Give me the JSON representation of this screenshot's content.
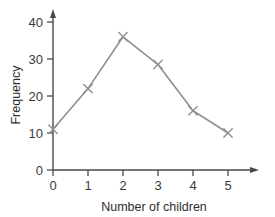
{
  "chart_data": {
    "type": "line",
    "title": "",
    "subtitle": "",
    "xlabel": "Number of children",
    "ylabel": "Frequency",
    "x": [
      0,
      1,
      2,
      3,
      4,
      5
    ],
    "categories": [
      "0",
      "1",
      "2",
      "3",
      "4",
      "5"
    ],
    "values": [
      11,
      22,
      36,
      28.5,
      16,
      10
    ],
    "series": [
      {
        "name": "Frequency",
        "values": [
          11,
          22,
          36,
          28.5,
          16,
          10
        ]
      }
    ],
    "xlim": [
      0,
      5
    ],
    "ylim": [
      0,
      40
    ],
    "xticks": [
      "0",
      "1",
      "2",
      "3",
      "4",
      "5"
    ],
    "yticks": [
      "0",
      "10",
      "20",
      "30",
      "40"
    ],
    "ytick_values": [
      0,
      10,
      20,
      30,
      40
    ],
    "grid": false,
    "legend": false,
    "legend_position": "none",
    "marker": "x-cross",
    "line_color": "#8f8f8f",
    "marker_color": "#8f8f8f",
    "axis_color": "#4a4a4a",
    "background_color": "#ffffff",
    "axis_arrows": true,
    "annotations": []
  },
  "axes": {
    "y_title": "Frequency",
    "x_title": "Number of children",
    "y_tick_labels": [
      "0",
      "10",
      "20",
      "30",
      "40"
    ],
    "x_tick_labels": [
      "0",
      "1",
      "2",
      "3",
      "4",
      "5"
    ]
  }
}
